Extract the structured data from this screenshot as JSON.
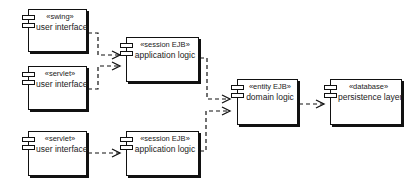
{
  "components": [
    {
      "id": "ui-swing",
      "stereotype": "«swing»",
      "name": "user interface"
    },
    {
      "id": "ui-servlet-1",
      "stereotype": "«servlet»",
      "name": "user interface"
    },
    {
      "id": "ui-servlet-2",
      "stereotype": "«servlet»",
      "name": "user interface"
    },
    {
      "id": "session-ejb-1",
      "stereotype": "«session EJB»",
      "name": "application logic"
    },
    {
      "id": "session-ejb-2",
      "stereotype": "«session EJB»",
      "name": "application logic"
    },
    {
      "id": "entity-ejb",
      "stereotype": "«entity EJB»",
      "name": "domain logic"
    },
    {
      "id": "database",
      "stereotype": "«database»",
      "name": "persistence layer"
    }
  ],
  "dependencies": [
    {
      "from": "ui-swing",
      "to": "session-ejb-1"
    },
    {
      "from": "ui-servlet-1",
      "to": "session-ejb-1"
    },
    {
      "from": "ui-servlet-2",
      "to": "session-ejb-2"
    },
    {
      "from": "session-ejb-1",
      "to": "entity-ejb"
    },
    {
      "from": "session-ejb-2",
      "to": "entity-ejb"
    },
    {
      "from": "entity-ejb",
      "to": "database"
    }
  ],
  "style": {
    "line_color": "#111111",
    "background": "#ffffff"
  }
}
